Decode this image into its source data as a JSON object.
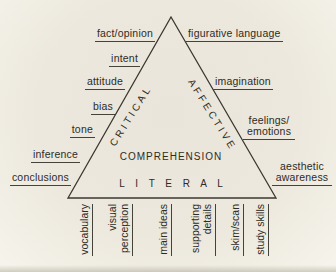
{
  "diagram": {
    "center_label": "COMPREHENSION",
    "base_inner_label": "L I T E R A L",
    "left_side_label": "CRITICAL",
    "right_side_label": "AFFECTIVE",
    "left_labels": [
      "fact/opinion",
      "intent",
      "attitude",
      "bias",
      "tone",
      "inference",
      "conclusions"
    ],
    "right_labels": [
      "figurative language",
      "imagination",
      "feelings/\nemotions",
      "aesthetic\nawareness"
    ],
    "bottom_labels": [
      "vocabulary",
      "visual\nperception",
      "main ideas",
      "supporting\ndetails",
      "skim/scan",
      "study skills"
    ]
  },
  "colors": {
    "paper": "#e9e5da",
    "ink": "#2e2b25",
    "line": "#45423a"
  }
}
